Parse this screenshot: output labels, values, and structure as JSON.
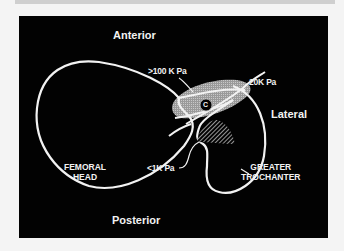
{
  "diagram": {
    "orientation_labels": {
      "anterior": "Anterior",
      "posterior": "Posterior",
      "lateral": "Lateral"
    },
    "pressure_labels": {
      "high": ">100 K Pa",
      "medium": "20K Pa",
      "low": "<1K Pa"
    },
    "structure_labels": {
      "femoral_head_line1": "FEMORAL",
      "femoral_head_line2": "HEAD",
      "greater_trochanter_line1": "GREATER",
      "greater_trochanter_line2": "TROCHANTER"
    },
    "marker": "C",
    "colors": {
      "background": "#020202",
      "outline": "#f2f2f2",
      "page": "#f4f4f4"
    }
  }
}
